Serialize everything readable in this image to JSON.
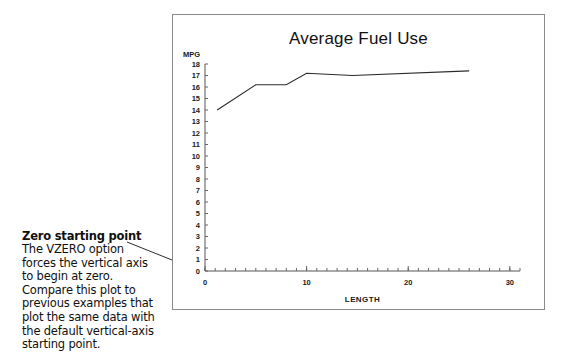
{
  "annotation": {
    "heading": "Zero starting point",
    "lines": [
      "The VZERO option",
      "forces the vertical axis",
      "to begin at zero.",
      "Compare this plot to",
      "previous examples that",
      "plot the same data with",
      "the default vertical-axis",
      "starting point."
    ]
  },
  "chart_data": {
    "type": "line",
    "title": "Average Fuel Use",
    "xlabel": "LENGTH",
    "ylabel": "MPG",
    "xlim": [
      0,
      31
    ],
    "ylim": [
      0,
      18
    ],
    "xticks": [
      0,
      10,
      20,
      30
    ],
    "xtick_labels": [
      "0",
      "10",
      "20",
      "30"
    ],
    "xminor_step": 1,
    "yticks": [
      0,
      1,
      2,
      3,
      4,
      5,
      6,
      7,
      8,
      9,
      10,
      11,
      12,
      13,
      14,
      15,
      16,
      17,
      18
    ],
    "ytick_labels": [
      "0",
      "1",
      "2",
      "3",
      "4",
      "5",
      "6",
      "7",
      "8",
      "9",
      "10",
      "11",
      "12",
      "13",
      "14",
      "15",
      "16",
      "17",
      "18"
    ],
    "grid": false,
    "legend": false,
    "series": [
      {
        "name": "Average Fuel Use",
        "color": "#2b2b2b",
        "x": [
          1.2,
          5.0,
          8.0,
          10.0,
          14.5,
          26.0
        ],
        "y": [
          14.0,
          16.2,
          16.2,
          17.2,
          17.0,
          17.4
        ]
      }
    ]
  },
  "colors": {
    "frame_border": "#8a8a8a",
    "axis": "#555555",
    "text": "#111111"
  }
}
